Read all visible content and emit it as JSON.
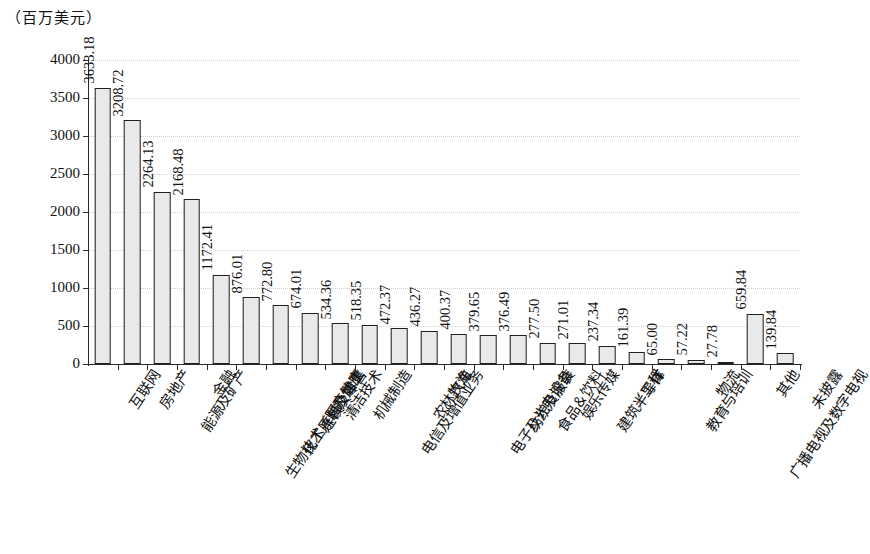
{
  "chart_data": {
    "type": "bar",
    "title": "",
    "subtitle": "",
    "xlabel": "",
    "ylabel": "（百万美元）",
    "ylim": [
      0,
      4000
    ],
    "ytick_step": 500,
    "yticks": [
      "0",
      "500",
      "1000",
      "1500",
      "2000",
      "2500",
      "3000",
      "3500",
      "4000"
    ],
    "grid": true,
    "grid_axis": "y",
    "legend": false,
    "legend_position": "none",
    "bar_fill_color": "#e9e9e9",
    "bar_edge_color": "#1f1f1f",
    "value_label_rotation": -90,
    "category_label_rotation": -56,
    "categories": [
      "互联网",
      "房地产",
      "能源及矿产",
      "金融",
      "生物技术／医疗健康",
      "化工原料及加工",
      "连锁及零售",
      "清洁技术",
      "机械制造",
      "电信及增值业务",
      "农林牧渔",
      "汽车",
      "电子及光电设备",
      "纺织及服装",
      "食品＆饮料",
      "娱乐传媒",
      "建筑／工程",
      "半导体",
      "IT",
      "教育与培训",
      "物流",
      "广播电视及数字电视",
      "其他",
      "未披露"
    ],
    "values": [
      3633.18,
      3208.72,
      2264.13,
      2168.48,
      1172.41,
      876.01,
      772.8,
      674.01,
      534.36,
      518.35,
      472.37,
      436.27,
      400.37,
      379.65,
      376.49,
      277.5,
      271.01,
      237.34,
      161.39,
      65.0,
      57.22,
      27.78,
      659.84,
      139.84
    ],
    "value_labels": [
      "3633.18",
      "3208.72",
      "2264.13",
      "2168.48",
      "1172.41",
      "876.01",
      "772.80",
      "674.01",
      "534.36",
      "518.35",
      "472.37",
      "436.27",
      "400.37",
      "379.65",
      "376.49",
      "277.50",
      "271.01",
      "237.34",
      "161.39",
      "65.00",
      "57.22",
      "27.78",
      "659.84",
      "139.84"
    ]
  }
}
